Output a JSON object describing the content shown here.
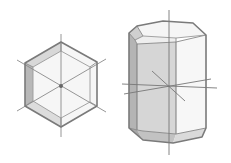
{
  "figure": {
    "panels": [
      {
        "name": "hexagon-top-view",
        "view": "basal plane, c-axis toward viewer"
      },
      {
        "name": "hexagonal-prism",
        "view": "oblique view of prism with pinacoid and bevelled edges"
      }
    ]
  },
  "colors": {
    "edge": "#7a7a7a",
    "axis": "#8a8a8a",
    "face_light": "#f4f4f4",
    "face_mid": "#d6d6d6",
    "face_dark": "#b8b8b8",
    "background": "#ffffff"
  }
}
